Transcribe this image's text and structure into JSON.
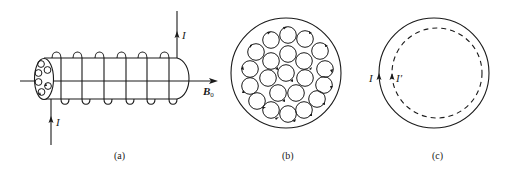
{
  "figure": {
    "panels": [
      {
        "id": "a",
        "caption": "(a)",
        "description": "Solenoid wound around a cylinder in axial field B0, current I in and out",
        "labels": {
          "current_top": "I",
          "current_bottom": "I",
          "field": "B",
          "field_subscript": "0"
        },
        "coil_turns": 6
      },
      {
        "id": "b",
        "caption": "(b)",
        "description": "Cross-section showing many small circulating current loops inside the cylinder"
      },
      {
        "id": "c",
        "caption": "(c)",
        "description": "Cross-section with surface current I (solid circle) and equivalent inner current I' (dashed circle)",
        "labels": {
          "current_outer": "I",
          "current_inner": "I′"
        }
      }
    ]
  }
}
